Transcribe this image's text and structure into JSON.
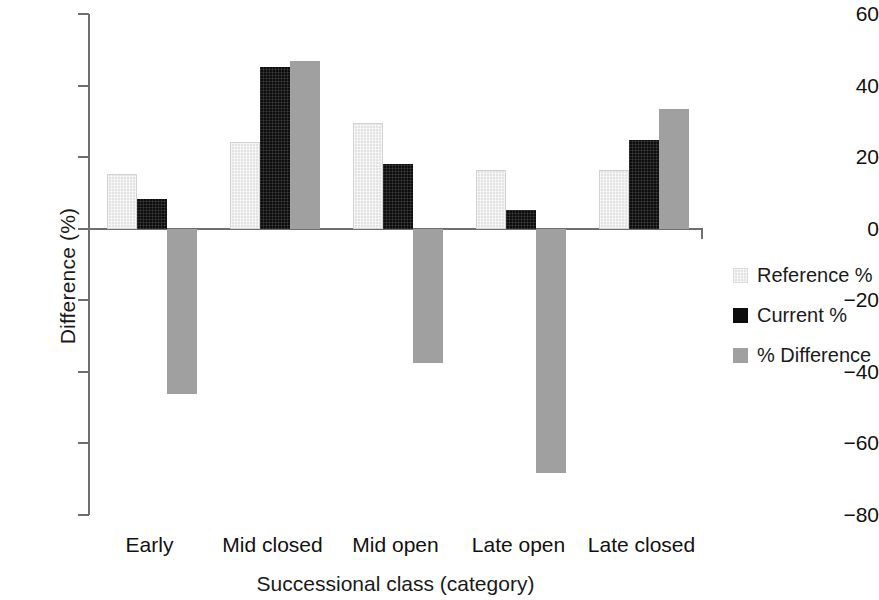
{
  "chart_data": {
    "type": "bar",
    "title": "",
    "xlabel": "Successional class (category)",
    "ylabel": "Difference (%)",
    "categories": [
      "Early",
      "Mid closed",
      "Mid open",
      "Late open",
      "Late closed"
    ],
    "series": [
      {
        "name": "Reference %",
        "color": "#e3e3e3",
        "values": [
          15.2,
          24.1,
          29.5,
          16.3,
          16.3
        ]
      },
      {
        "name": "Current %",
        "color": "#0d0d0d",
        "values": [
          8.4,
          45.2,
          18.0,
          5.3,
          24.7
        ]
      },
      {
        "name": "% Difference",
        "color": "#a0a0a0",
        "values": [
          -46.3,
          46.9,
          -37.6,
          -68.2,
          33.4
        ]
      }
    ],
    "ylim": [
      -80,
      60
    ],
    "yticks": [
      60,
      40,
      20,
      0,
      -20,
      -40,
      -60,
      -80
    ],
    "ytick_labels": [
      "60",
      "40",
      "20",
      "0",
      "−20",
      "−40",
      "−60",
      "−80"
    ],
    "grid": false,
    "legend_position": "right",
    "zero_line": true
  },
  "legend": {
    "entries": [
      {
        "label": "Reference %",
        "swatch": "reference"
      },
      {
        "label": "Current %",
        "swatch": "current"
      },
      {
        "label": "% Difference",
        "swatch": "difference"
      }
    ]
  }
}
